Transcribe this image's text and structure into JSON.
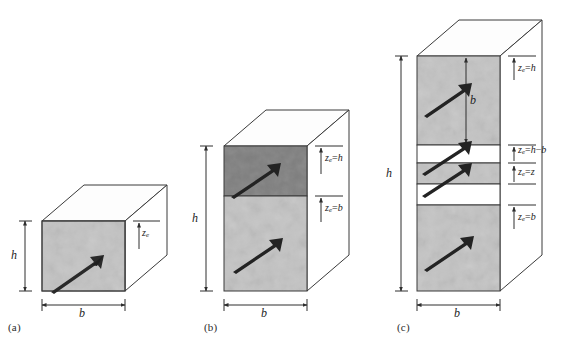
{
  "figure": {
    "background": "#ffffff",
    "line_color": "#3a3a3a",
    "face_light": "#c3c3c3",
    "face_dark": "#7f7f7f",
    "face_white": "#ffffff",
    "top_face": "#fdfdfd"
  },
  "panels": [
    {
      "id": "a",
      "label": "(a)",
      "height_label": "h",
      "width_label": "b",
      "zones": [
        {
          "fill": "#c3c3c3",
          "tick_label_html": "z<sub>e</sub>",
          "tick_label_text": "ze",
          "arrow": true
        }
      ],
      "side_labels": [
        {
          "text": "ze",
          "html": "<i>z</i><sub>e</sub>"
        }
      ]
    },
    {
      "id": "b",
      "label": "(b)",
      "height_label": "h",
      "width_label": "b",
      "zones": [
        {
          "fill": "#7f7f7f",
          "arrow": true
        },
        {
          "fill": "#c3c3c3",
          "arrow": true
        }
      ],
      "side_labels": [
        {
          "text": "ze=h",
          "html": "<i>z</i><sub>e</sub>=<i>h</i>"
        },
        {
          "text": "ze=b",
          "html": "<i>z</i><sub>e</sub>=<i>b</i>"
        }
      ]
    },
    {
      "id": "c",
      "label": "(c)",
      "height_label": "h",
      "width_label": "b",
      "inner_dim_label": "b",
      "zones": [
        {
          "fill": "#c3c3c3",
          "arrow": true
        },
        {
          "fill": "#ffffff",
          "arrow": false
        },
        {
          "fill": "#c3c3c3",
          "arrow": true
        },
        {
          "fill": "#ffffff",
          "arrow": true
        },
        {
          "fill": "#c3c3c3",
          "arrow": true
        }
      ],
      "side_labels": [
        {
          "text": "ze=h",
          "html": "<i>z</i><sub>e</sub>=<i>h</i>"
        },
        {
          "text": "ze=h-b",
          "html": "<i>z</i><sub>e</sub>=<i>h</i>−<i>b</i>"
        },
        {
          "text": "ze=z",
          "html": "<i>z</i><sub>e</sub>=<i>z</i>"
        },
        {
          "text": "ze=b",
          "html": "<i>z</i><sub>e</sub>=<i>b</i>"
        }
      ]
    }
  ]
}
